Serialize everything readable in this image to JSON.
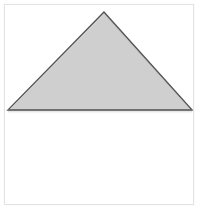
{
  "figure": {
    "canvas": {
      "width": 200,
      "height": 219,
      "background_color": "#ffffff"
    },
    "frame": {
      "name": "image-border-frame",
      "x": 4,
      "y": 4,
      "width": 190,
      "height": 201,
      "background_color": "#ffffff",
      "border_color": "#e3e3e3",
      "border_width": 1
    },
    "shape": {
      "type": "triangle",
      "classification": "isosceles",
      "apex": {
        "x": 100,
        "y": 7
      },
      "base_left": {
        "x": 3,
        "y": 106
      },
      "base_right": {
        "x": 189,
        "y": 106
      },
      "fill_color": "#cfcfcf",
      "stroke_color": "#555555",
      "stroke_width": 1.4,
      "highlight_color": "#f2f2f2",
      "base_shadow_color": "#8a8a8a"
    },
    "empty_region": {
      "name": "blank-lower-area",
      "fill_color": "#ffffff"
    }
  },
  "watermark": {
    "text": "",
    "color": "#e8e8e8"
  }
}
